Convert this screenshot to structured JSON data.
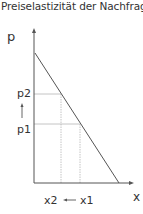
{
  "title": "Preiselastizität der Nachfrage =",
  "diagram": {
    "y_axis_label": "p",
    "x_axis_label": "x",
    "price_labels": [
      "p2",
      "p1"
    ],
    "quantity_labels": [
      "x2",
      "x1"
    ],
    "price_change_arrow": "↑",
    "quantity_change_arrow": "←",
    "colors": {
      "axis": "#555555",
      "line": "#555555",
      "guide": "#aaaaaa",
      "text": "#333333"
    }
  }
}
